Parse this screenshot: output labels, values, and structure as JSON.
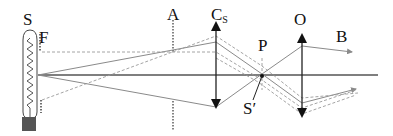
{
  "labels": {
    "source": "S",
    "field_stop": "F",
    "aperture": "A",
    "condenser": "C",
    "condenser_sub": "S",
    "pupil_point": "P",
    "objective": "O",
    "beam": "B",
    "source_image": "S′"
  },
  "colors": {
    "ray": "#8a8a8a",
    "axis": "#555555",
    "lens": "#222222",
    "bulb_base": "#555555",
    "dashed": "#999999"
  },
  "elements": {
    "bulb": {
      "type": "lamp with coiled filament",
      "label": "S"
    },
    "field_stop": {
      "type": "dotted aperture marks",
      "label": "F"
    },
    "aperture_stop": {
      "type": "dotted vertical line",
      "label": "A"
    },
    "condenser_lens": {
      "type": "converging lens (double arrow)",
      "label": "Cs"
    },
    "source_image_point": {
      "type": "focal point on axis",
      "label": "S′",
      "near": "P"
    },
    "objective_lens": {
      "type": "converging lens (double arrow)",
      "label": "O"
    },
    "output_beam": {
      "type": "ray arrows",
      "label": "B"
    }
  }
}
